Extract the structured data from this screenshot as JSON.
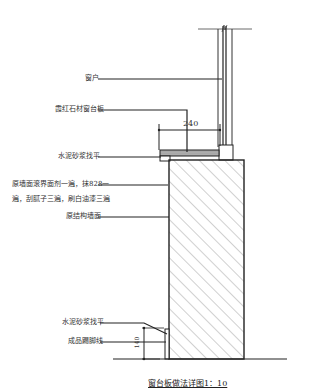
{
  "labels": {
    "window": "窗户",
    "stone_sill": "霞红石材窗台板",
    "mortar_top": "水泥砂浆找平",
    "wall_finish_line1": "原墙面滚界面剂一遍，抹828一",
    "wall_finish_line2": "遍，刮腻子三遍，刷白油漆三遍",
    "structure_wall": "原结构墙面",
    "mortar_bottom": "水泥砂浆找平",
    "baseboard": "成品踢脚线"
  },
  "dimensions": {
    "sill_width": "240",
    "baseboard_height": "140"
  },
  "title": "窗台板做法详图1：10"
}
